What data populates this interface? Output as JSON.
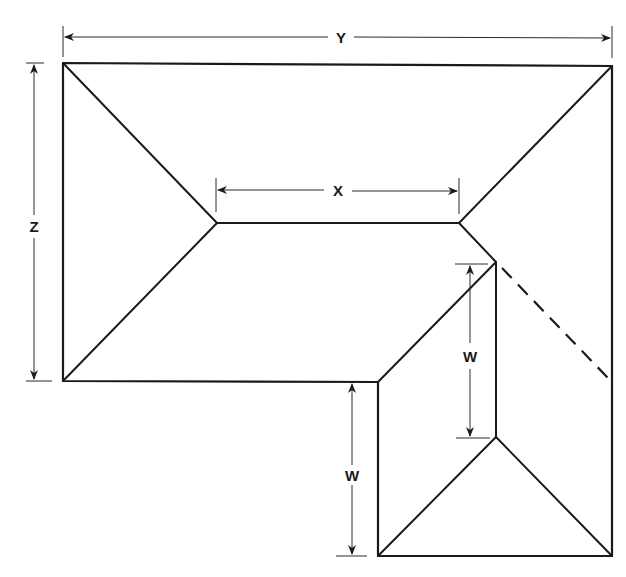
{
  "diagram": {
    "type": "roof-plan",
    "colors": {
      "line": "#1a1a1a",
      "background": "#ffffff"
    },
    "dimensions": {
      "Y": {
        "label": "Y",
        "meaning": "overall width of main roof"
      },
      "Z": {
        "label": "Z",
        "meaning": "depth of main roof"
      },
      "X": {
        "label": "X",
        "meaning": "length of main ridge"
      },
      "W_upper": {
        "label": "W",
        "meaning": "wing ridge length"
      },
      "W_lower": {
        "label": "W",
        "meaning": "wing extension length"
      }
    },
    "features": [
      "outer-outline",
      "hip-lines",
      "main-ridge",
      "wing-ridge",
      "valley-lines",
      "dashed-hidden-hip"
    ]
  }
}
